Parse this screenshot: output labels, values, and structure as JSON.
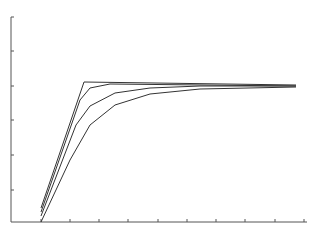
{
  "chart_data": {
    "type": "line",
    "title": "",
    "xlabel": "",
    "ylabel": "",
    "grid": false,
    "legend": null,
    "x_ticks_px": [
      41,
      70,
      99,
      128,
      158,
      187,
      216,
      245,
      275,
      304
    ],
    "y_ticks_px": [
      17,
      51,
      86,
      120,
      155,
      190
    ],
    "axis": {
      "x0": 11,
      "x1": 307,
      "y0": 222,
      "y1": 17
    },
    "colors": {
      "axis": "#555555",
      "line": "#333333"
    },
    "series": [
      {
        "name": "curve-1",
        "points": [
          [
            41,
            208
          ],
          [
            84,
            82
          ],
          [
            296,
            85
          ]
        ]
      },
      {
        "name": "curve-2",
        "points": [
          [
            41,
            212
          ],
          [
            80,
            100
          ],
          [
            90,
            88
          ],
          [
            110,
            84
          ],
          [
            296,
            86
          ]
        ]
      },
      {
        "name": "curve-3",
        "points": [
          [
            41,
            216
          ],
          [
            76,
            125
          ],
          [
            90,
            106
          ],
          [
            115,
            93
          ],
          [
            150,
            88
          ],
          [
            200,
            86
          ],
          [
            296,
            86
          ]
        ]
      },
      {
        "name": "curve-4",
        "points": [
          [
            41,
            222
          ],
          [
            70,
            160
          ],
          [
            90,
            125
          ],
          [
            115,
            105
          ],
          [
            150,
            94
          ],
          [
            200,
            89
          ],
          [
            296,
            87
          ]
        ]
      }
    ]
  }
}
